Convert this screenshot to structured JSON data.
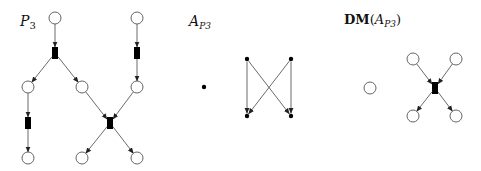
{
  "panels": [
    {
      "id": "petri-net",
      "label_main": "P",
      "label_sub": "3",
      "places": [
        {
          "id": "p1",
          "x": 55,
          "y": 18
        },
        {
          "id": "p2",
          "x": 137,
          "y": 18
        },
        {
          "id": "p3",
          "x": 28,
          "y": 87
        },
        {
          "id": "p4",
          "x": 82,
          "y": 87
        },
        {
          "id": "p5",
          "x": 137,
          "y": 87
        },
        {
          "id": "p6",
          "x": 28,
          "y": 158
        },
        {
          "id": "p7",
          "x": 82,
          "y": 158
        },
        {
          "id": "p8",
          "x": 137,
          "y": 158
        }
      ],
      "transitions": [
        {
          "id": "t1",
          "x": 55,
          "y": 53
        },
        {
          "id": "t2",
          "x": 137,
          "y": 53
        },
        {
          "id": "t3",
          "x": 28,
          "y": 123
        },
        {
          "id": "t4",
          "x": 110,
          "y": 123
        }
      ],
      "arcs": [
        [
          "p1",
          "t1"
        ],
        [
          "t1",
          "p3"
        ],
        [
          "t1",
          "p4"
        ],
        [
          "p2",
          "t2"
        ],
        [
          "t2",
          "p5"
        ],
        [
          "p3",
          "t3"
        ],
        [
          "t3",
          "p6"
        ],
        [
          "p4",
          "t4"
        ],
        [
          "p5",
          "t4"
        ],
        [
          "t4",
          "p7"
        ],
        [
          "t4",
          "p8"
        ]
      ]
    },
    {
      "id": "automaton",
      "label_main": "A",
      "label_sub": "P3",
      "nodes": [
        {
          "id": "n0",
          "x": 204,
          "y": 87
        },
        {
          "id": "n1",
          "x": 247,
          "y": 59
        },
        {
          "id": "n2",
          "x": 291,
          "y": 59
        },
        {
          "id": "n3",
          "x": 247,
          "y": 116
        },
        {
          "id": "n4",
          "x": 291,
          "y": 116
        }
      ],
      "edges": [
        [
          "n1",
          "n3"
        ],
        [
          "n1",
          "n4"
        ],
        [
          "n2",
          "n3"
        ],
        [
          "n2",
          "n4"
        ]
      ]
    },
    {
      "id": "dm-net",
      "label_main": "DM",
      "label_paren_open": "(",
      "label_inner": "A",
      "label_sub": "P3",
      "label_paren_close": ")",
      "places": [
        {
          "id": "q0",
          "x": 370,
          "y": 88
        },
        {
          "id": "q1",
          "x": 413,
          "y": 59
        },
        {
          "id": "q2",
          "x": 456,
          "y": 59
        },
        {
          "id": "q3",
          "x": 413,
          "y": 116
        },
        {
          "id": "q4",
          "x": 456,
          "y": 116
        }
      ],
      "transitions": [
        {
          "id": "u1",
          "x": 435,
          "y": 88
        }
      ],
      "arcs": [
        [
          "q1",
          "u1"
        ],
        [
          "q2",
          "u1"
        ],
        [
          "u1",
          "q3"
        ],
        [
          "u1",
          "q4"
        ]
      ]
    }
  ]
}
